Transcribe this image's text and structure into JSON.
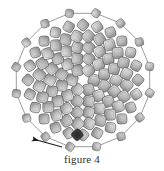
{
  "figure": {
    "caption": "figure 4",
    "background_color": "#ffffff",
    "ink_color": "#2b2b2b",
    "tile_fill_light": "#d9d9d9",
    "tile_fill_mid": "#b3b3b3",
    "tile_fill_dark": "#8c8c8c",
    "tile_stroke": "#4a4a4a",
    "link_stroke": "#5a5a5a",
    "highlight_tile_fill": "#2e2e2e",
    "arrow_color": "#1a1a1a"
  },
  "chart_data": {
    "type": "scatter",
    "title": "figure 4",
    "xlabel": "",
    "ylabel": "",
    "center": [
      83,
      80
    ],
    "rings": [
      {
        "name": "ring-1",
        "radius": 11,
        "count": 6,
        "tile_size": 11,
        "phase_deg": 0,
        "twist_deg": 18
      },
      {
        "name": "ring-2",
        "radius": 22,
        "count": 12,
        "tile_size": 11,
        "phase_deg": 15,
        "twist_deg": 24
      },
      {
        "name": "ring-3",
        "radius": 33,
        "count": 18,
        "tile_size": 11,
        "phase_deg": 0,
        "twist_deg": 30
      },
      {
        "name": "ring-4",
        "radius": 44,
        "count": 24,
        "tile_size": 11,
        "phase_deg": 7,
        "twist_deg": 36
      },
      {
        "name": "ring-5",
        "radius": 55,
        "count": 24,
        "tile_size": 10,
        "phase_deg": 0,
        "twist_deg": 42
      },
      {
        "name": "ring-6-outer-linked",
        "radius": 68,
        "count": 16,
        "tile_size": 8,
        "phase_deg": 11,
        "twist_deg": 20
      }
    ],
    "outer_ring_linked": true,
    "highlight_tile": {
      "ring": "ring-5",
      "angle_deg": 96,
      "label": "marked tile"
    },
    "annotation_arrow": {
      "from": [
        62,
        147
      ],
      "to": [
        33,
        139
      ],
      "label": ""
    },
    "grid": false,
    "legend": null
  },
  "elements": {
    "diagram_name": "rosette-tiling-diagram",
    "arrow_name": "annotation-arrow",
    "caption_name": "figure-caption"
  }
}
